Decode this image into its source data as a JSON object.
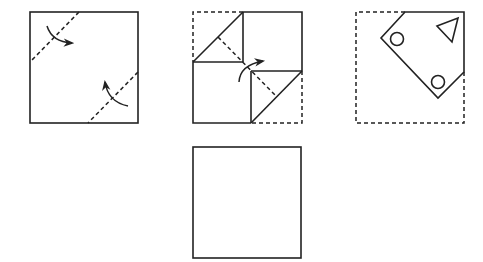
{
  "diagram": {
    "type": "paper-folding-puzzle",
    "colors": {
      "stroke": "#222222",
      "background": "#ffffff"
    },
    "figures": [
      {
        "id": "step-1",
        "description": "Square with two dashed diagonal fold lines at top-left and bottom-right corners, with curved arrows indicating folding inward",
        "outline": "solid-square",
        "fold_lines": 2,
        "arrows": 2
      },
      {
        "id": "step-2",
        "description": "Square with top-left and bottom-right corners folded in (dashed original outline), curved arrow indicating a diagonal fold",
        "outline": "dashed-square",
        "fold_lines": 1,
        "arrows": 1
      },
      {
        "id": "step-3",
        "description": "Folded pentagon shape inside dashed original square with punched holes: two circles and one triangle",
        "outline": "dashed-square",
        "holes": [
          {
            "shape": "circle",
            "position": "left"
          },
          {
            "shape": "triangle",
            "position": "top-right"
          },
          {
            "shape": "circle",
            "position": "bottom"
          }
        ]
      },
      {
        "id": "answer",
        "description": "Empty square for the unfolded result",
        "outline": "solid-square"
      }
    ]
  }
}
